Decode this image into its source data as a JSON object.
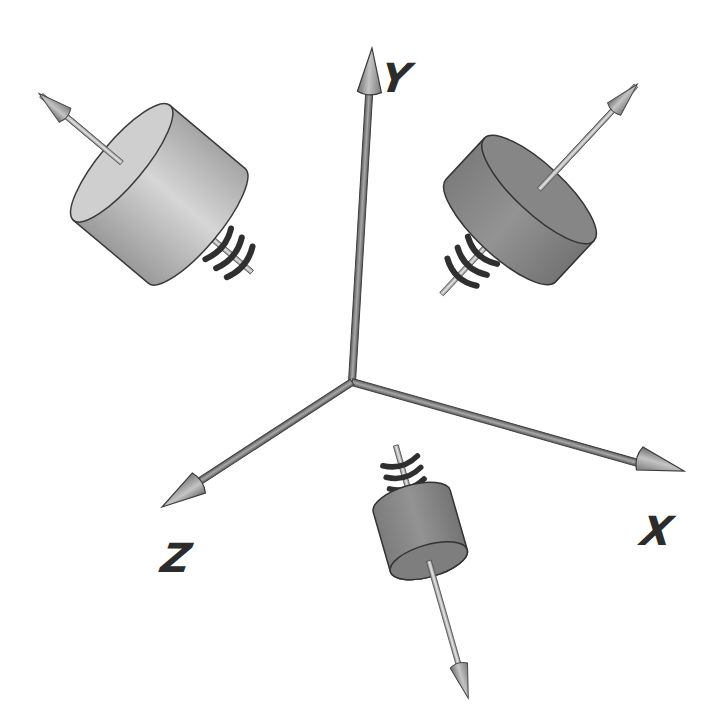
{
  "diagram": {
    "title": "",
    "axes": [
      {
        "id": "y",
        "label": "Y",
        "origin": [
          352,
          382
        ],
        "tip": [
          372,
          48
        ]
      },
      {
        "id": "x",
        "label": "X",
        "origin": [
          352,
          382
        ],
        "tip": [
          683,
          470
        ]
      },
      {
        "id": "z",
        "label": "Z",
        "origin": [
          352,
          382
        ],
        "tip": [
          163,
          505
        ]
      }
    ],
    "components": [
      {
        "id": "upper-left",
        "type": "cylinder-with-spring",
        "shade": "light",
        "vector_direction": "up-left"
      },
      {
        "id": "upper-right",
        "type": "cylinder-with-spring",
        "shade": "dark",
        "vector_direction": "up-right"
      },
      {
        "id": "bottom",
        "type": "cylinder-with-spring",
        "shade": "dark",
        "vector_direction": "down"
      }
    ],
    "colors": {
      "axis": "#8a8a8a",
      "axis_edge": "#4a4a4a",
      "cylinder_light": "#bdbdbd",
      "cylinder_dark": "#8c8c8c",
      "spring": "#3a3a3a",
      "vector": "#c8c8c8"
    }
  }
}
